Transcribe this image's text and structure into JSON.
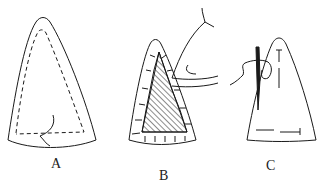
{
  "figure": {
    "panels": [
      {
        "id": "A",
        "label": "A",
        "description": "Triangular fabric piece with dashed inner stitching line and loose thread"
      },
      {
        "id": "B",
        "label": "B",
        "description": "Triangular piece with hatched inner triangle being turned under with hand, edge tick marks"
      },
      {
        "id": "C",
        "label": "C",
        "description": "Triangular piece with needle and thread, running stitch marks"
      }
    ],
    "stroke_color": "#1a1a1a",
    "background": "#ffffff"
  }
}
